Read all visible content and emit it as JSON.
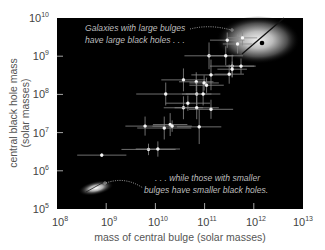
{
  "chart_data": {
    "type": "scatter",
    "title": "",
    "xlabel": "mass of central bulge (solar masses)",
    "ylabel_line1": "central black hole mass",
    "ylabel_line2": "(solar masses)",
    "x_scale": "log",
    "y_scale": "log",
    "xlim": [
      100000000.0,
      10000000000000.0
    ],
    "ylim": [
      100000.0,
      10000000000.0
    ],
    "grid": false,
    "background": "#000000",
    "x_ticks": [
      {
        "base": "10",
        "exp": "8"
      },
      {
        "base": "10",
        "exp": "9"
      },
      {
        "base": "10",
        "exp": "10"
      },
      {
        "base": "10",
        "exp": "11"
      },
      {
        "base": "10",
        "exp": "12"
      },
      {
        "base": "10",
        "exp": "13"
      }
    ],
    "y_ticks": [
      {
        "base": "10",
        "exp": "10"
      },
      {
        "base": "10",
        "exp": "9"
      },
      {
        "base": "10",
        "exp": "8"
      },
      {
        "base": "10",
        "exp": "7"
      },
      {
        "base": "10",
        "exp": "6"
      },
      {
        "base": "10",
        "exp": "5"
      }
    ],
    "annotations": [
      {
        "line1": "Galaxies with large bulges",
        "line2": "have large black holes . . ."
      },
      {
        "line1": ". . . while those with smaller",
        "line2": "bulges have smaller black holes."
      }
    ],
    "series": [
      {
        "name": "galaxies",
        "points_log10": [
          {
            "x": 8.91,
            "y": 6.41,
            "xerr": 0.5,
            "yerr": 0.05
          },
          {
            "x": 9.86,
            "y": 6.56,
            "xerr": 0.55,
            "yerr": 0.15
          },
          {
            "x": 10.05,
            "y": 6.57,
            "xerr": 0.45,
            "yerr": 0.2
          },
          {
            "x": 9.79,
            "y": 7.17,
            "xerr": 0.4,
            "yerr": 0.25
          },
          {
            "x": 10.18,
            "y": 7.12,
            "xerr": 0.55,
            "yerr": 0.3
          },
          {
            "x": 10.3,
            "y": 7.21,
            "xerr": 0.35,
            "yerr": 0.3
          },
          {
            "x": 10.34,
            "y": 7.17,
            "xerr": 0.4,
            "yerr": 0.15
          },
          {
            "x": 10.89,
            "y": 7.15,
            "xerr": 0.45,
            "yerr": 0.45
          },
          {
            "x": 10.57,
            "y": 7.65,
            "xerr": 0.4,
            "yerr": 0.3
          },
          {
            "x": 10.66,
            "y": 7.77,
            "xerr": 0.45,
            "yerr": 0.2
          },
          {
            "x": 10.84,
            "y": 7.65,
            "xerr": 0.45,
            "yerr": 0.3
          },
          {
            "x": 11.13,
            "y": 7.61,
            "xerr": 0.45,
            "yerr": 0.25
          },
          {
            "x": 10.21,
            "y": 8.01,
            "xerr": 0.6,
            "yerr": 0.3
          },
          {
            "x": 10.84,
            "y": 8.01,
            "xerr": 0.3,
            "yerr": 0.3
          },
          {
            "x": 10.97,
            "y": 8.01,
            "xerr": 0.35,
            "yerr": 0.3
          },
          {
            "x": 10.57,
            "y": 8.38,
            "xerr": 0.45,
            "yerr": 0.3
          },
          {
            "x": 10.83,
            "y": 8.33,
            "xerr": 0.35,
            "yerr": 0.25
          },
          {
            "x": 10.99,
            "y": 8.3,
            "xerr": 0.3,
            "yerr": 0.2
          },
          {
            "x": 11.04,
            "y": 8.24,
            "xerr": 0.35,
            "yerr": 0.2
          },
          {
            "x": 11.13,
            "y": 8.51,
            "xerr": 0.4,
            "yerr": 0.4
          },
          {
            "x": 11.5,
            "y": 8.53,
            "xerr": 0.3,
            "yerr": 0.25
          },
          {
            "x": 11.09,
            "y": 9.01,
            "xerr": 0.5,
            "yerr": 0.35
          },
          {
            "x": 11.43,
            "y": 9.01,
            "xerr": 0.35,
            "yerr": 0.25
          },
          {
            "x": 11.56,
            "y": 8.74,
            "xerr": 0.45,
            "yerr": 0.3
          },
          {
            "x": 11.56,
            "y": 8.66,
            "xerr": 0.3,
            "yerr": 0.2
          },
          {
            "x": 11.74,
            "y": 8.74,
            "xerr": 0.3,
            "yerr": 0.2
          },
          {
            "x": 11.46,
            "y": 9.42,
            "xerr": 0.35,
            "yerr": 0.2
          },
          {
            "x": 11.77,
            "y": 9.48,
            "xerr": 0.3,
            "yerr": 0.2
          },
          {
            "x": 11.67,
            "y": 9.32,
            "xerr": 0.3,
            "yerr": 0.25
          }
        ]
      }
    ]
  }
}
